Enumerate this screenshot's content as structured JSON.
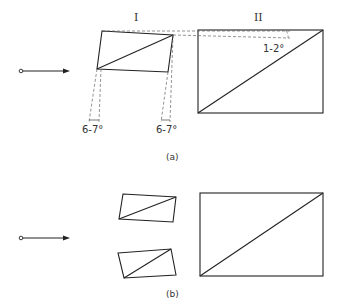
{
  "panel_a": {
    "caption": "(a)",
    "label_I": "I",
    "label_II": "II",
    "angle_left": "6-7°",
    "angle_right": "6-7°",
    "angle_top": "1-2°"
  },
  "panel_b": {
    "caption": "(b)"
  },
  "colors": {
    "line": "#222222",
    "dashed": "#666666",
    "background": "#ffffff"
  }
}
